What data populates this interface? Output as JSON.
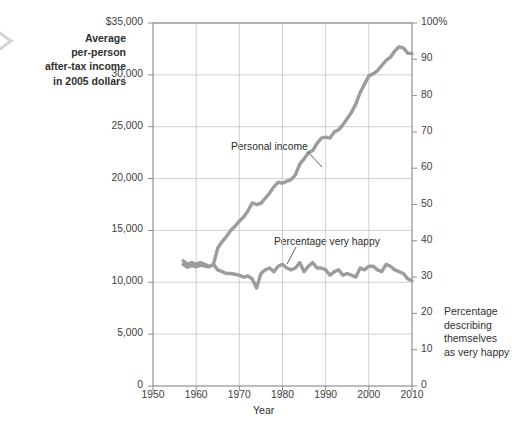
{
  "axis_titles": {
    "left_lines": [
      "Average",
      "per-person",
      "after-tax income",
      "in 2005 dollars"
    ],
    "right_lines": [
      "Percentage",
      "describing",
      "themselves",
      "as very happy"
    ],
    "xlabel": "Year"
  },
  "icons": {
    "left_chevron": "chevron-right-icon"
  },
  "colors": {
    "line": "#9c9c9c",
    "grid": "#c9c9c9",
    "frame": "#8f8f8f",
    "text": "#2f2f2f",
    "background": "#ffffff"
  },
  "chart_data": {
    "type": "line",
    "title": "",
    "xlabel": "Year",
    "ylabel": "Average per-person after-tax income in 2005 dollars",
    "y2label": "Percentage describing themselves as very happy",
    "xlim": [
      1950,
      2010
    ],
    "ylim": [
      0,
      35000
    ],
    "y2lim": [
      0,
      100
    ],
    "grid": true,
    "legend_position": "inline-annotations",
    "xticks": [
      1950,
      1960,
      1970,
      1980,
      1990,
      2000,
      2010
    ],
    "xticklabels": [
      "1950",
      "1960",
      "1970",
      "1980",
      "1990",
      "2000",
      "2010"
    ],
    "yticks": [
      0,
      5000,
      10000,
      15000,
      20000,
      25000,
      30000,
      35000
    ],
    "yticklabels": [
      "0",
      "5,000",
      "10,000",
      "15,000",
      "20,000",
      "25,000",
      "30,000",
      "$35,000"
    ],
    "y2ticks": [
      0,
      10,
      20,
      30,
      40,
      50,
      60,
      70,
      80,
      90,
      100
    ],
    "y2ticklabels": [
      "0",
      "10",
      "20",
      "30",
      "40",
      "50",
      "60",
      "70",
      "80",
      "90",
      "100%"
    ],
    "series": [
      {
        "name": "Personal income",
        "axis": "left",
        "units": "2005 dollars",
        "x": [
          1957,
          1958,
          1959,
          1960,
          1961,
          1962,
          1963,
          1964,
          1965,
          1966,
          1967,
          1968,
          1969,
          1970,
          1971,
          1972,
          1973,
          1974,
          1975,
          1976,
          1977,
          1978,
          1979,
          1980,
          1981,
          1982,
          1983,
          1984,
          1985,
          1986,
          1987,
          1988,
          1989,
          1990,
          1991,
          1992,
          1993,
          1994,
          1995,
          1996,
          1997,
          1998,
          1999,
          2000,
          2001,
          2002,
          2003,
          2004,
          2005,
          2006,
          2007,
          2008,
          2009,
          2010
        ],
        "values": [
          11700,
          11450,
          11600,
          11500,
          11650,
          11550,
          11500,
          11700,
          13300,
          13900,
          14400,
          15000,
          15400,
          15900,
          16300,
          16900,
          17650,
          17500,
          17600,
          18100,
          18600,
          19200,
          19650,
          19550,
          19750,
          19900,
          20350,
          21400,
          21900,
          22500,
          22700,
          23400,
          23900,
          24000,
          23900,
          24500,
          24700,
          25200,
          25800,
          26400,
          27200,
          28300,
          29100,
          29900,
          30100,
          30400,
          30900,
          31400,
          31700,
          32300,
          32700,
          32600,
          32100,
          32050
        ]
      },
      {
        "name": "Percentage very happy",
        "axis": "right",
        "units": "percent",
        "x": [
          1957,
          1958,
          1959,
          1960,
          1961,
          1962,
          1963,
          1964,
          1965,
          1966,
          1967,
          1968,
          1969,
          1970,
          1971,
          1972,
          1973,
          1974,
          1975,
          1976,
          1977,
          1978,
          1979,
          1980,
          1981,
          1982,
          1983,
          1984,
          1985,
          1986,
          1987,
          1988,
          1989,
          1990,
          1991,
          1992,
          1993,
          1994,
          1995,
          1996,
          1997,
          1998,
          1999,
          2000,
          2001,
          2002,
          2003,
          2004,
          2005,
          2006,
          2007,
          2008,
          2009,
          2010
        ],
        "values": [
          34.5,
          33.5,
          34.0,
          33.5,
          34.0,
          33.5,
          33.0,
          33.5,
          32.0,
          31.5,
          31.0,
          31.0,
          30.8,
          30.5,
          30.0,
          30.3,
          29.5,
          27.0,
          31.0,
          32.0,
          32.5,
          31.5,
          33.0,
          33.5,
          32.5,
          32.0,
          32.5,
          34.0,
          31.5,
          33.0,
          34.0,
          32.5,
          32.5,
          32.0,
          30.5,
          31.5,
          32.0,
          30.5,
          31.0,
          30.5,
          30.0,
          32.5,
          32.0,
          33.0,
          33.0,
          32.0,
          31.5,
          33.5,
          33.0,
          32.0,
          31.5,
          31.0,
          29.5,
          29.0
        ]
      }
    ],
    "annotations": [
      {
        "text": "Personal income",
        "x": 1976,
        "y": 24200
      },
      {
        "text": "Percentage very happy",
        "x": 1984,
        "y": 14000
      }
    ]
  }
}
